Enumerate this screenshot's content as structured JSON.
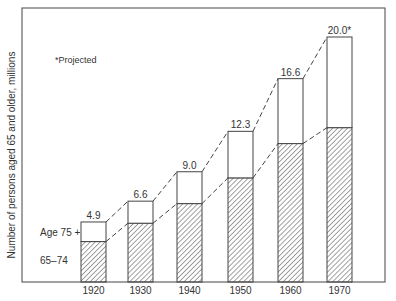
{
  "chart_data": {
    "type": "bar",
    "stacked": true,
    "title": "",
    "xlabel": "",
    "ylabel": "Number of persons aged 65 and older, millions",
    "categories": [
      "1920",
      "1930",
      "1940",
      "1950",
      "1960",
      "1970"
    ],
    "totals": [
      4.9,
      6.6,
      9.0,
      12.3,
      16.6,
      20.0
    ],
    "total_labels": [
      "4.9",
      "6.6",
      "9.0",
      "12.3",
      "16.6",
      "20.0*"
    ],
    "series": [
      {
        "name": "65–74",
        "values": [
          3.3,
          4.8,
          6.4,
          8.5,
          11.3,
          12.6
        ],
        "fill": "hatched"
      },
      {
        "name": "Age 75 +",
        "values": [
          1.6,
          1.8,
          2.6,
          3.8,
          5.3,
          7.4
        ],
        "fill": "white"
      }
    ],
    "ylim": [
      0,
      22
    ],
    "grid": false,
    "legend_position": "inline-left",
    "annotations": [
      "*Projected"
    ],
    "connectors": "dashed lines joining tops of each segment between adjacent bars"
  },
  "labels": {
    "ylabel": "Number of persons aged 65 and older, millions",
    "footnote": "*Projected",
    "legend_upper": "Age 75 +",
    "legend_lower": "65–74"
  },
  "colors": {
    "line": "#333333",
    "background": "#ffffff"
  }
}
